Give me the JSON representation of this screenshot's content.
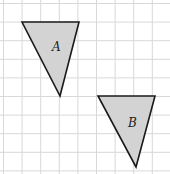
{
  "diagram": {
    "grid": {
      "spacing": 18.6,
      "origin": [
        3.5,
        3.5
      ],
      "cols": 9,
      "rows": 9,
      "color": "#d8d8d8"
    },
    "shapes": [
      {
        "id": "A",
        "label": "A",
        "points": [
          [
            22,
            22
          ],
          [
            79,
            22
          ],
          [
            60,
            96
          ]
        ],
        "label_pos": [
          52,
          51
        ],
        "fill": "#d3d3d3",
        "stroke": "#1a1a1a"
      },
      {
        "id": "B",
        "label": "B",
        "points": [
          [
            98,
            96
          ],
          [
            155,
            96
          ],
          [
            136,
            167
          ]
        ],
        "label_pos": [
          128,
          127
        ],
        "fill": "#d3d3d3",
        "stroke": "#1a1a1a"
      }
    ]
  }
}
